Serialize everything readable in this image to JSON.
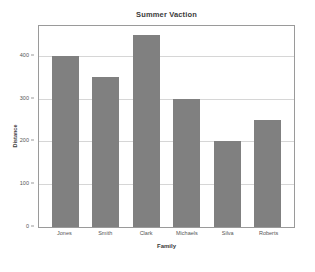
{
  "chart_data": {
    "type": "bar",
    "title": "Summer Vaction",
    "xlabel": "Family",
    "ylabel": "Distance",
    "categories": [
      "Jones",
      "Smith",
      "Clark",
      "Michaels",
      "Silva",
      "Roberts"
    ],
    "values": [
      400,
      350,
      450,
      300,
      200,
      250
    ],
    "ylim": [
      0,
      470
    ],
    "yticks": [
      0,
      100,
      200,
      300,
      400
    ],
    "ytick_labels": [
      "0",
      "100",
      "200",
      "300",
      "400"
    ],
    "grid": true,
    "grid_axis": "y",
    "legend": false,
    "bar_color": "#808080",
    "grid_color": "#d6d6d6",
    "frame_color": "#9a9a9a",
    "background_color": "#ffffff",
    "text_color": "#555555"
  }
}
